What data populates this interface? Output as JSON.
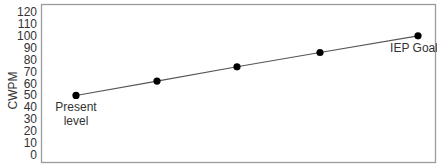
{
  "chart_data": {
    "type": "line",
    "title": "",
    "xlabel": "",
    "ylabel": "CWPM",
    "ylim": [
      0,
      120
    ],
    "yticks": [
      0,
      10,
      20,
      30,
      40,
      50,
      60,
      70,
      80,
      90,
      100,
      110,
      120
    ],
    "grid": false,
    "legend": null,
    "series": [
      {
        "name": "Goal line",
        "x": [
          1,
          2,
          3,
          4,
          5
        ],
        "values": [
          50,
          62,
          74,
          86,
          100
        ],
        "marker": "filled-circle",
        "color": "#000000"
      }
    ],
    "annotations": [
      {
        "point_index": 0,
        "text_lines": [
          "Present",
          "level"
        ],
        "position": "below"
      },
      {
        "point_index": 4,
        "text_lines": [
          "IEP Goal"
        ],
        "position": "below"
      }
    ]
  },
  "layout": {
    "plot": {
      "left": 41,
      "top": 4,
      "right": 436,
      "bottom": 163
    },
    "y_pixel_for_0": 155,
    "y_pixel_for_120": 12,
    "point_x_pixels": [
      76,
      157,
      237,
      320,
      418
    ],
    "frame_color": "#9a9a9a",
    "line_color": "#555555",
    "marker_color": "#000000",
    "text_color": "#333333"
  }
}
